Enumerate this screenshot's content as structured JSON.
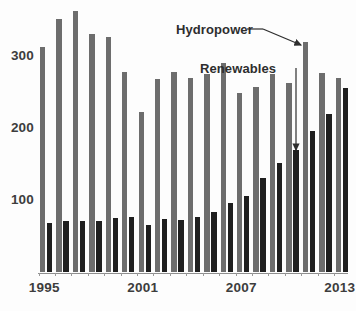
{
  "chart_data": {
    "type": "bar",
    "title": "",
    "subtitle": "",
    "xlabel": "",
    "ylabel": "",
    "grid": false,
    "legend_position": "annotations-inline",
    "ylim": [
      0,
      380
    ],
    "yticks": [
      100,
      200,
      300
    ],
    "ytick_labels": [
      "100",
      "200",
      "300"
    ],
    "xticks": [
      1995,
      2001,
      2007,
      2013
    ],
    "xtick_labels": [
      "1995",
      "2001",
      "2007",
      "2013"
    ],
    "categories": [
      "1995",
      "1996",
      "1997",
      "1998",
      "1999",
      "2000",
      "2001",
      "2002",
      "2003",
      "2004",
      "2005",
      "2006",
      "2007",
      "2008",
      "2009",
      "2010",
      "2011",
      "2012",
      "2013"
    ],
    "series": [
      {
        "name": "Hydropower",
        "color": "#6d6d6d",
        "values": [
          312,
          352,
          362,
          330,
          327,
          278,
          222,
          268,
          278,
          270,
          275,
          290,
          249,
          257,
          275,
          263,
          320,
          277,
          270
        ]
      },
      {
        "name": "Renewables",
        "color": "#1f1f1f",
        "values": [
          68,
          71,
          71,
          71,
          75,
          76,
          65,
          74,
          72,
          76,
          84,
          96,
          106,
          131,
          151,
          169,
          196,
          219,
          255
        ]
      }
    ],
    "annotations": [
      {
        "label": "Hydropower",
        "kind": "arrow-annotation",
        "points_to_series": "Hydropower",
        "points_to_category": "2011",
        "points_to_value": 320
      },
      {
        "label": "Renewables",
        "kind": "arrow-annotation",
        "points_to_series": "Renewables",
        "points_to_category": "2011",
        "points_to_value": 169
      }
    ]
  },
  "axis": {
    "y_ticks": [
      {
        "label": "300",
        "value": 300
      },
      {
        "label": "200",
        "value": 200
      },
      {
        "label": "100",
        "value": 100
      }
    ],
    "x_ticks": [
      {
        "label": "1995",
        "value": 1995
      },
      {
        "label": "2001",
        "value": 2001
      },
      {
        "label": "2007",
        "value": 2007
      },
      {
        "label": "2013",
        "value": 2013
      }
    ]
  },
  "annotations": {
    "hydropower_label": "Hydropower",
    "renewables_label": "Renewables"
  },
  "colors": {
    "hydropower": "#6d6d6d",
    "renewables": "#1f1f1f",
    "axis": "#8e8e8e",
    "text": "#3d3d3d",
    "background": "#fdfdfd"
  }
}
